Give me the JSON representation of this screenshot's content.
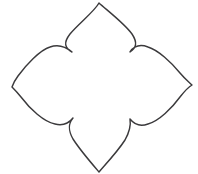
{
  "canvas": {
    "width": 198,
    "height": 174,
    "background_color": "#ffffff",
    "alt_text": "Quatrefoil four-petal flower outline drawing"
  },
  "figure": {
    "name": "quatrefoil-flower-outline",
    "style": {
      "stroke_color": "#3b3a3c",
      "fill_color": "#ffffff",
      "stroke_width": 1.45,
      "line_style": "solid",
      "rendering": "hand-drawn line art"
    },
    "geometry": {
      "center": {
        "x": 101,
        "y": 86
      },
      "petal_count": 4,
      "petal_tips": [
        {
          "name": "top-petal-tip",
          "x": 99,
          "y": 3
        },
        {
          "name": "right-petal-tip",
          "x": 192,
          "y": 85
        },
        {
          "name": "bottom-petal-tip",
          "x": 99,
          "y": 172
        },
        {
          "name": "left-petal-tip",
          "x": 12,
          "y": 87
        }
      ],
      "cusp_points": [
        {
          "name": "cusp-top-left",
          "x": 72,
          "y": 52
        },
        {
          "name": "cusp-top-right",
          "x": 130,
          "y": 52
        },
        {
          "name": "cusp-bottom-right",
          "x": 130,
          "y": 119
        },
        {
          "name": "cusp-bottom-left",
          "x": 73,
          "y": 118
        }
      ],
      "path": "M 99 3 C 94 12, 78 24, 70 34 C 63 43, 65 48, 72 52 C 65 46, 58 44, 50 47 C 40 50, 26 65, 18 76 C 15 80, 13 84, 12 87 C 14 89, 17 92, 21 97 C 30 109, 44 122, 55 124 C 63 126, 69 123, 73 118 C 68 124, 68 130, 73 139 C 80 150, 93 165, 99 172 C 105 165, 118 151, 125 140 C 130 131, 131 125, 130 119 C 134 124, 140 127, 148 124 C 159 121, 172 108, 180 97 C 184 92, 187 88, 192 85 C 189 82, 185 79, 180 73 C 171 62, 158 50, 148 47 C 140 44, 134 46, 130 52 C 136 48, 138 43, 132 34 C 125 24, 108 11, 99 3 Z"
    }
  }
}
